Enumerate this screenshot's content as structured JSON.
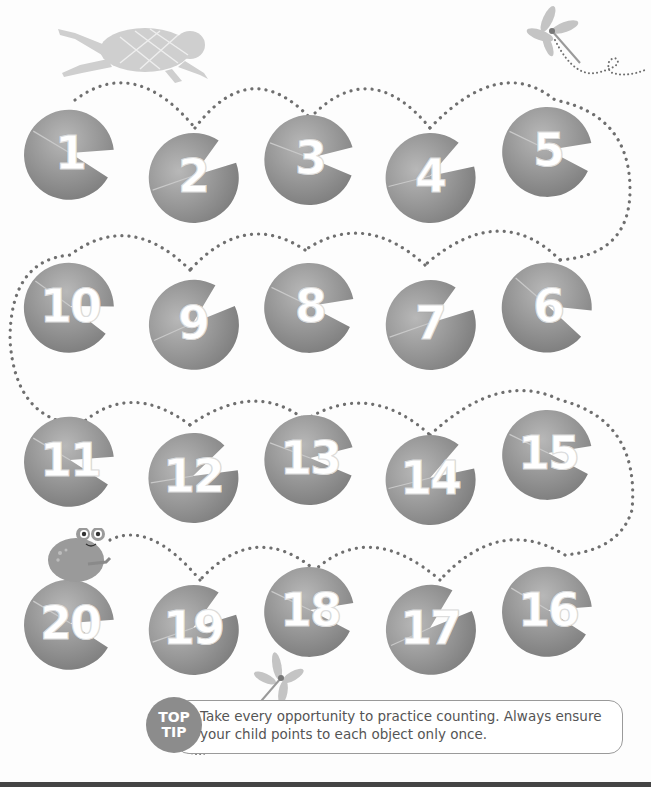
{
  "page": {
    "colors": {
      "lily_pad": "#8e8e8e",
      "dots": "#6f6f6f",
      "text": "#555555",
      "badge": "#8c8c8c"
    }
  },
  "lily_pads": [
    {
      "number": "1",
      "row": 1
    },
    {
      "number": "2",
      "row": 1
    },
    {
      "number": "3",
      "row": 1
    },
    {
      "number": "4",
      "row": 1
    },
    {
      "number": "5",
      "row": 1
    },
    {
      "number": "10",
      "row": 2
    },
    {
      "number": "9",
      "row": 2
    },
    {
      "number": "8",
      "row": 2
    },
    {
      "number": "7",
      "row": 2
    },
    {
      "number": "6",
      "row": 2
    },
    {
      "number": "11",
      "row": 3
    },
    {
      "number": "12",
      "row": 3
    },
    {
      "number": "13",
      "row": 3
    },
    {
      "number": "14",
      "row": 3
    },
    {
      "number": "15",
      "row": 3
    },
    {
      "number": "20",
      "row": 4
    },
    {
      "number": "19",
      "row": 4
    },
    {
      "number": "18",
      "row": 4
    },
    {
      "number": "17",
      "row": 4
    },
    {
      "number": "16",
      "row": 4
    }
  ],
  "decorations": {
    "top_left": "jumping-frog-icon",
    "top_right": "dragonfly-icon",
    "bottom_left_frog": "sitting-frog-icon",
    "bottom_dragonfly": "dragonfly-icon"
  },
  "tip": {
    "badge_line1": "TOP",
    "badge_line2": "TIP",
    "text": "Take every opportunity to practice counting. Always ensure your child points to each object only once."
  }
}
